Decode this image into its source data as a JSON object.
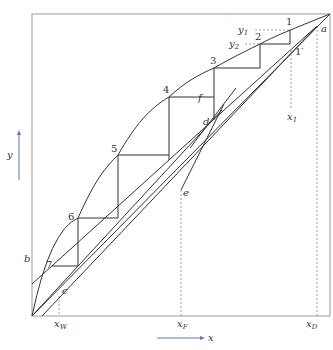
{
  "diagram": {
    "type": "McCabe-Thiele distillation stage construction",
    "axes": {
      "x_label": "x",
      "y_label": "y",
      "x_ticks": [
        {
          "label": "x",
          "sub": "W"
        },
        {
          "label": "x",
          "sub": "F"
        },
        {
          "label": "x",
          "sub": "D"
        }
      ]
    },
    "points": {
      "a": "a",
      "b": "b",
      "c": "c",
      "d": "d",
      "e": "e",
      "f": "f",
      "one_prime": "1′"
    },
    "stages": [
      "1",
      "2",
      "3",
      "4",
      "5",
      "6",
      "7"
    ],
    "annotations": {
      "y1": {
        "label": "y",
        "sub": "1"
      },
      "y2": {
        "label": "y",
        "sub": "2"
      },
      "x1": {
        "label": "x",
        "sub": "1"
      }
    },
    "colors": {
      "line": "#333333",
      "axis_arrow": "#5a7fa8",
      "dashed": "#888888",
      "frame": "#9a9a9a"
    }
  }
}
